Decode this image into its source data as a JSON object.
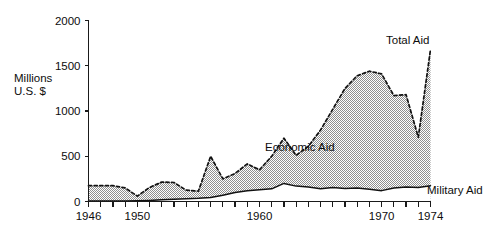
{
  "figure": {
    "axis_title_line1": "Millions",
    "axis_title_line2": "U.S. $",
    "label_total": "Total Aid",
    "label_economic": "Economic Aid",
    "label_military": "Military Aid",
    "ink_color": "#111111",
    "fill_color": "#c9c9c9"
  },
  "chart_data": {
    "type": "area",
    "title": "",
    "subtitle": "",
    "xlabel": "",
    "ylabel": "Millions U.S. $",
    "xlim": [
      1946,
      1974
    ],
    "ylim": [
      0,
      2000
    ],
    "grid": false,
    "legend_position": "inline-annotations",
    "stacked": true,
    "ytick_labels": [
      "0",
      "500",
      "1000",
      "1500",
      "2000"
    ],
    "yticks": [
      0,
      500,
      1000,
      1500,
      2000
    ],
    "xticks": [
      1946,
      1947,
      1948,
      1949,
      1950,
      1951,
      1952,
      1953,
      1954,
      1955,
      1956,
      1957,
      1958,
      1959,
      1960,
      1961,
      1962,
      1963,
      1964,
      1965,
      1966,
      1967,
      1968,
      1969,
      1970,
      1971,
      1972,
      1973,
      1974
    ],
    "xtick_labels_shown": [
      "1946",
      "1950",
      "1960",
      "1970",
      "1974"
    ],
    "x": [
      1946,
      1947,
      1948,
      1949,
      1950,
      1951,
      1952,
      1953,
      1954,
      1955,
      1956,
      1957,
      1958,
      1959,
      1960,
      1961,
      1962,
      1963,
      1964,
      1965,
      1966,
      1967,
      1968,
      1969,
      1970,
      1971,
      1972,
      1973,
      1974
    ],
    "series": [
      {
        "name": "Total Aid",
        "style": "dashed-line-upper-boundary",
        "values": [
          175,
          175,
          175,
          150,
          60,
          155,
          215,
          210,
          125,
          115,
          500,
          250,
          310,
          415,
          350,
          500,
          700,
          510,
          610,
          790,
          1020,
          1250,
          1390,
          1440,
          1410,
          1170,
          1180,
          710,
          1680
        ]
      },
      {
        "name": "Military Aid",
        "style": "solid-line-lower-boundary",
        "values": [
          5,
          5,
          5,
          5,
          8,
          12,
          18,
          25,
          30,
          35,
          45,
          70,
          100,
          120,
          130,
          140,
          200,
          170,
          160,
          140,
          155,
          145,
          150,
          135,
          120,
          150,
          160,
          155,
          175
        ]
      },
      {
        "name": "Economic Aid",
        "style": "shaded-band-between",
        "values": [
          170,
          170,
          170,
          145,
          52,
          143,
          197,
          185,
          95,
          80,
          455,
          180,
          210,
          295,
          220,
          360,
          500,
          340,
          450,
          650,
          865,
          1105,
          1240,
          1305,
          1290,
          1020,
          1020,
          555,
          1505
        ]
      }
    ],
    "annotations": [
      {
        "text": "Total Aid",
        "x": 1972.2,
        "y": 1860
      },
      {
        "text": "Economic Aid",
        "x": 1964.0,
        "y": 560
      },
      {
        "text": "Military Aid",
        "x": 1974.6,
        "y": 210
      }
    ]
  }
}
